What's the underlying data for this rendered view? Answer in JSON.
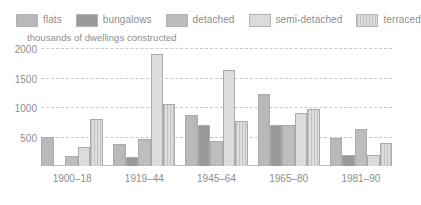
{
  "legend": {
    "items": [
      {
        "label": "flats",
        "key": "flats",
        "color": "#b9b9b9"
      },
      {
        "label": "bungalows",
        "key": "bungalows",
        "color": "#9a9a9a"
      },
      {
        "label": "detached",
        "key": "detached",
        "color": "#bdbdbd"
      },
      {
        "label": "semi-detached",
        "key": "semi-detached",
        "color": "#dcdcdc"
      },
      {
        "label": "terraced",
        "key": "terraced",
        "color": "#cfcfcf"
      }
    ]
  },
  "chart_data": {
    "type": "bar",
    "title": "",
    "subtitle": "",
    "ylabel": "thousands of dwellings constructed",
    "xlabel": "",
    "categories": [
      "1900–18",
      "1919–44",
      "1945–64",
      "1965–80",
      "1981–90"
    ],
    "series": [
      {
        "name": "flats",
        "values": [
          490,
          370,
          860,
          1220,
          470
        ]
      },
      {
        "name": "bungalows",
        "values": [
          0,
          160,
          700,
          690,
          190
        ]
      },
      {
        "name": "detached",
        "values": [
          170,
          460,
          430,
          700,
          620
        ]
      },
      {
        "name": "semi-detached",
        "values": [
          320,
          1900,
          1620,
          900,
          180
        ]
      },
      {
        "name": "terraced",
        "values": [
          790,
          1050,
          770,
          970,
          390
        ]
      }
    ],
    "ylim": [
      0,
      2000
    ],
    "yticks": [
      500,
      1000,
      1500,
      2000
    ],
    "ytick_labels": [
      "500",
      "1000",
      "1500",
      "2000"
    ],
    "grid": true,
    "grid_style": "dashed",
    "legend_position": "top"
  }
}
